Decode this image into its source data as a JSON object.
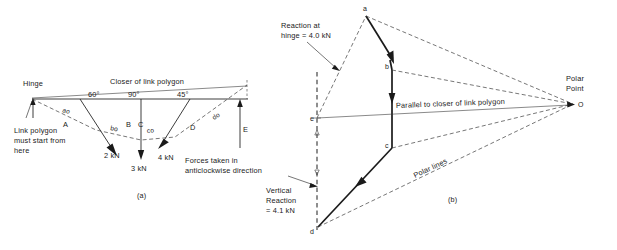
{
  "figure": {
    "title_implicit": "Link polygon and polar (force) diagram",
    "panel_a_label": "(a)",
    "panel_b_label": "(b)"
  },
  "panel_a": {
    "annotations": {
      "hinge": "Hinge",
      "closer": "Closer of link polygon",
      "start_note_line1": "Link polygon",
      "start_note_line2": "must start from",
      "start_note_line3": "here",
      "direction_note_line1": "Forces taken in",
      "direction_note_line2": "anticlockwise direction"
    },
    "angles": [
      "60°",
      "90°",
      "45°"
    ],
    "space_labels": [
      "A",
      "B",
      "C",
      "D",
      "E"
    ],
    "ray_labels": [
      "ao",
      "bo",
      "co",
      "do"
    ],
    "forces": [
      {
        "label": "2 kN",
        "value": 2,
        "unit": "kN",
        "inclination": "60°",
        "space": "A-B"
      },
      {
        "label": "3 kN",
        "value": 3,
        "unit": "kN",
        "inclination": "90°",
        "space": "B-C"
      },
      {
        "label": "4 kN",
        "value": 4,
        "unit": "kN",
        "inclination": "45°",
        "space": "C-D"
      }
    ]
  },
  "panel_b": {
    "annotations": {
      "reaction_hinge_line1": "Reaction at",
      "reaction_hinge_line2": "hinge = 4.0 kN",
      "vertical_reaction_line1": "Vertical",
      "vertical_reaction_line2": "Reaction",
      "vertical_reaction_line3": "= 4.1 kN",
      "parallel_closer": "Parallel to closer of link polygon",
      "polar_lines": "Polar lines",
      "polar_point_line1": "Polar",
      "polar_point_line2": "Point"
    },
    "vertices": [
      "a",
      "b",
      "c",
      "d",
      "e"
    ],
    "pole_label": "O",
    "reactions": [
      {
        "name": "Reaction at hinge",
        "value": 4.0,
        "unit": "kN",
        "label": "4.0 kN"
      },
      {
        "name": "Vertical Reaction",
        "value": 4.1,
        "unit": "kN",
        "label": "4.1 kN"
      }
    ],
    "vectors": [
      {
        "from": "a",
        "to": "b",
        "label": "2 kN",
        "value": 2
      },
      {
        "from": "b",
        "to": "c",
        "label": "3 kN",
        "value": 3
      },
      {
        "from": "c",
        "to": "d",
        "label": "4 kN",
        "value": 4
      }
    ]
  },
  "colors": {
    "ink": "#1a1a1a",
    "dashed": "#3c3c3c",
    "paper": "#ffffff"
  }
}
